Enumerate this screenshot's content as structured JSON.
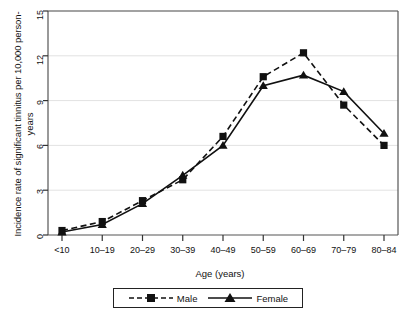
{
  "chart_data": {
    "type": "line",
    "title": "",
    "xlabel": "Age (years)",
    "ylabel": "Incidence rate of significant tinnitus per 10,000 person-years",
    "categories": [
      "<10",
      "10–19",
      "20–29",
      "30–39",
      "40–49",
      "50–59",
      "60–69",
      "70–79",
      "80–84"
    ],
    "ylim": [
      0,
      15
    ],
    "yticks": [
      "0",
      "3",
      "6",
      "9",
      "12",
      "15"
    ],
    "ytick_values": [
      0,
      3,
      6,
      9,
      12,
      15
    ],
    "grid": "horizontal",
    "legend_position": "below-axis",
    "series": [
      {
        "name": "Male",
        "marker": "square",
        "linestyle": "dashed",
        "color": "#111111",
        "values": [
          0.3,
          0.9,
          2.3,
          3.7,
          6.6,
          10.6,
          12.2,
          8.7,
          6.0
        ]
      },
      {
        "name": "Female",
        "marker": "triangle",
        "linestyle": "solid",
        "color": "#111111",
        "values": [
          0.2,
          0.7,
          2.1,
          4.0,
          6.0,
          10.0,
          10.7,
          9.6,
          6.8
        ]
      }
    ]
  },
  "legend": {
    "entries": [
      {
        "label": "Male"
      },
      {
        "label": "Female"
      }
    ]
  }
}
